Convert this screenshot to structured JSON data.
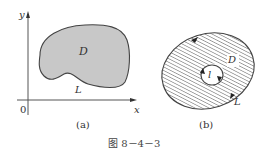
{
  "figure": {
    "caption": "图 8－4－3",
    "colors": {
      "stroke": "#444444",
      "region_fill": "#c8c8c8",
      "hatch": "#555555",
      "background": "#ffffff"
    }
  },
  "panel_a": {
    "sublabel": "(a)",
    "axes": {
      "x_label": "x",
      "y_label": "y",
      "origin_label": "0"
    },
    "region_label": "D",
    "boundary_label": "L",
    "region_style": "solid-gray"
  },
  "panel_b": {
    "sublabel": "(b)",
    "region_label": "D",
    "outer_boundary_label": "L",
    "inner_boundary_label": "l",
    "region_style": "diagonal-hatch"
  }
}
